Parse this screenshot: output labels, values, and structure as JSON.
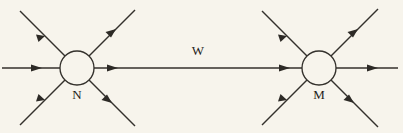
{
  "figure": {
    "type": "vertex-interaction-diagram",
    "background_color": "#f7f4ec",
    "line_color": "#34312c",
    "label_color": "#1f1d1a",
    "width": 403,
    "height": 133
  },
  "vertices": [
    {
      "id": "N",
      "label": "N",
      "cx": 77,
      "cy": 68,
      "r": 17,
      "label_x": 77,
      "label_y": 96
    },
    {
      "id": "M",
      "label": "M",
      "cx": 319,
      "cy": 68,
      "r": 17,
      "label_x": 319,
      "label_y": 96
    }
  ],
  "propagator": {
    "label": "W",
    "label_x": 198,
    "label_y": 52,
    "from": "N",
    "to": "M",
    "direction": "right",
    "arrow_positions": [
      110,
      285
    ]
  },
  "external_lines": [
    {
      "id": "n-in-upper-left",
      "vertex": "N",
      "direction": "incoming",
      "angle_deg": 135,
      "arrow_at": 0.55
    },
    {
      "id": "n-in-lower-left",
      "vertex": "N",
      "direction": "incoming",
      "angle_deg": 225,
      "arrow_at": 0.55
    },
    {
      "id": "n-in-left",
      "vertex": "N",
      "direction": "incoming",
      "angle_deg": 180,
      "arrow_at": 0.52
    },
    {
      "id": "n-out-upper-right",
      "vertex": "N",
      "direction": "outgoing",
      "angle_deg": 45,
      "arrow_at": 0.45
    },
    {
      "id": "n-out-lower-right",
      "vertex": "N",
      "direction": "outgoing",
      "angle_deg": 315,
      "arrow_at": 0.35
    },
    {
      "id": "m-in-upper-left",
      "vertex": "M",
      "direction": "incoming",
      "angle_deg": 135,
      "arrow_at": 0.55
    },
    {
      "id": "m-in-lower-left",
      "vertex": "M",
      "direction": "incoming",
      "angle_deg": 225,
      "arrow_at": 0.55
    },
    {
      "id": "m-out-upper-right",
      "vertex": "M",
      "direction": "outgoing",
      "angle_deg": 45,
      "arrow_at": 0.45
    },
    {
      "id": "m-out-lower-right",
      "vertex": "M",
      "direction": "outgoing",
      "angle_deg": 315,
      "arrow_at": 0.35
    },
    {
      "id": "m-out-right",
      "vertex": "M",
      "direction": "outgoing",
      "angle_deg": 0,
      "arrow_at": 0.48
    }
  ]
}
